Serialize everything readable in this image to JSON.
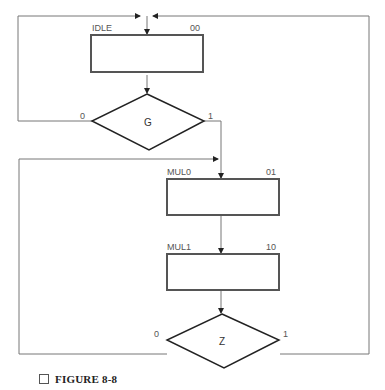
{
  "diagram": {
    "type": "ASM chart",
    "states": [
      {
        "name": "IDLE",
        "code": "00"
      },
      {
        "name": "MUL0",
        "code": "01"
      },
      {
        "name": "MUL1",
        "code": "10"
      }
    ],
    "decisions": [
      {
        "condition": "G",
        "false_label": "0",
        "true_label": "1"
      },
      {
        "condition": "Z",
        "false_label": "0",
        "true_label": "1"
      }
    ],
    "transitions": [
      {
        "from": "IDLE",
        "to": "G"
      },
      {
        "from": "G",
        "label": "0",
        "to": "IDLE"
      },
      {
        "from": "G",
        "label": "1",
        "to": "MUL0"
      },
      {
        "from": "MUL0",
        "to": "MUL1"
      },
      {
        "from": "MUL1",
        "to": "Z"
      },
      {
        "from": "Z",
        "label": "0",
        "to": "MUL0"
      },
      {
        "from": "Z",
        "label": "1",
        "to": "IDLE"
      }
    ],
    "colors": {
      "box_border": "#555555",
      "line": "#777777",
      "diamond": "#222222"
    }
  },
  "caption": "FIGURE 8-8"
}
